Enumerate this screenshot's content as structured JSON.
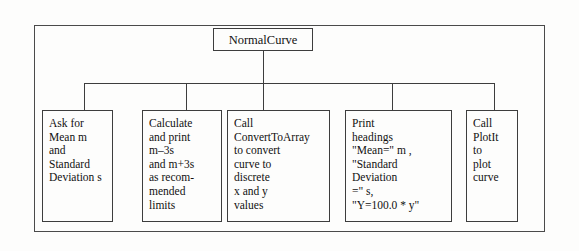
{
  "diagram": {
    "frame_color": "#4a4a4a",
    "line_color": "#3d3d3d",
    "background": "#fdfdfc",
    "root": {
      "label": "NormalCurve"
    },
    "modules": [
      {
        "name": "ask-for-input",
        "text": "Ask for\nMean m\nand\nStandard\nDeviation s"
      },
      {
        "name": "calculate-limits",
        "text": "Calculate\nand print\nm–3s\nand m+3s\nas recom-\nmended\nlimits"
      },
      {
        "name": "call-converttoarray",
        "text": "Call\nConvertToArray\nto convert\ncurve to\ndiscrete\nx and y\nvalues"
      },
      {
        "name": "print-headings",
        "text": "Print\nheadings\n\"Mean=\" m ,\n\"Standard\n Deviation\n =\" s,\n\"Y=100.0 * y\""
      },
      {
        "name": "call-plotit",
        "text": "Call\nPlotIt\nto\nplot\ncurve"
      }
    ]
  }
}
